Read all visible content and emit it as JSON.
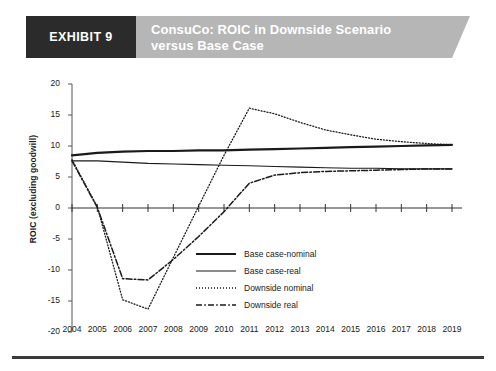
{
  "banner": {
    "tag": "EXHIBIT 9",
    "title_line1": "ConsuCo: ROIC in Downside Scenario",
    "title_line2": "versus Base Case",
    "tag_bg": "#2b2b2b",
    "title_bg": "#b6b6b6"
  },
  "chart_data": {
    "type": "line",
    "title": "ConsuCo: ROIC in Downside Scenario versus Base Case",
    "xlabel": "",
    "ylabel": "ROIC (excluding goodwill)",
    "x": [
      "2004",
      "2005",
      "2006",
      "2007",
      "2008",
      "2009",
      "2010",
      "2011",
      "2012",
      "2013",
      "2014",
      "2015",
      "2016",
      "2017",
      "2018",
      "2019"
    ],
    "ylim": [
      -20,
      20
    ],
    "yticks": [
      "20",
      "15",
      "10",
      "5",
      "0",
      "-5",
      "-10",
      "-15",
      "-20"
    ],
    "ytick_values": [
      20,
      15,
      10,
      5,
      0,
      -5,
      -10,
      -15,
      -20
    ],
    "xlim": [
      2004,
      2019
    ],
    "grid": false,
    "legend_position": "center-right-inside",
    "series": [
      {
        "name": "Base case-nominal",
        "style": "solid-thick",
        "color": "#1a1a1a",
        "values": [
          8.5,
          8.9,
          9.1,
          9.2,
          9.2,
          9.3,
          9.3,
          9.4,
          9.5,
          9.6,
          9.7,
          9.8,
          9.9,
          10.0,
          10.1,
          10.2
        ]
      },
      {
        "name": "Base case-real",
        "style": "solid-thin",
        "color": "#1a1a1a",
        "values": [
          7.6,
          7.6,
          7.4,
          7.2,
          7.1,
          7.0,
          6.9,
          6.8,
          6.7,
          6.6,
          6.5,
          6.4,
          6.4,
          6.3,
          6.3,
          6.3
        ]
      },
      {
        "name": "Downside nominal",
        "style": "dotted",
        "color": "#1a1a1a",
        "values": [
          7.8,
          0.2,
          -14.8,
          -16.3,
          -8.0,
          0.3,
          8.5,
          16.1,
          15.2,
          13.8,
          12.6,
          11.8,
          11.1,
          10.7,
          10.4,
          10.2
        ]
      },
      {
        "name": "Downside real",
        "style": "dash-dot",
        "color": "#1a1a1a",
        "values": [
          7.6,
          0.1,
          -11.4,
          -11.6,
          -8.3,
          -4.6,
          -0.6,
          4.0,
          5.3,
          5.7,
          5.9,
          6.0,
          6.1,
          6.2,
          6.3,
          6.3
        ]
      }
    ]
  }
}
